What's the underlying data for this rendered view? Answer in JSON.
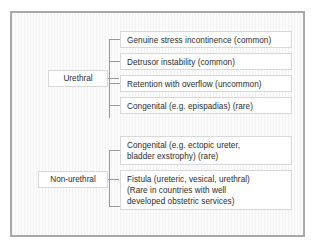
{
  "diagram": {
    "frame": {
      "border_color": "#a9a9a9",
      "background_color": "#fbfbfb",
      "stripe_color": "#f2f2f2"
    },
    "connector_color": "#9a9a9a",
    "box_border_color": "#d8d8d8",
    "box_background_color": "#ffffff",
    "text_color": "#2b2b2b",
    "groups": [
      {
        "id": "urethral",
        "label": "Urethral",
        "items": [
          {
            "id": "genuine-stress-incontinence",
            "text": "Genuine stress incontinence (common)"
          },
          {
            "id": "detrusor-instability",
            "text": "Detrusor instability (common)"
          },
          {
            "id": "retention-with-overflow",
            "text": "Retention with overflow (uncommon)"
          },
          {
            "id": "congenital-epispadias",
            "text": "Congenital (e.g. epispadias) (rare)"
          }
        ]
      },
      {
        "id": "non-urethral",
        "label": "Non-urethral",
        "items": [
          {
            "id": "congenital-ectopic-ureter",
            "text": "Congenital (e.g. ectopic ureter,\nbladder exstrophy) (rare)"
          },
          {
            "id": "fistula",
            "text": "Fistula (ureteric, vesical, urethral)\n(Rare in countries with well\ndeveloped obstetric services)"
          }
        ]
      }
    ]
  }
}
